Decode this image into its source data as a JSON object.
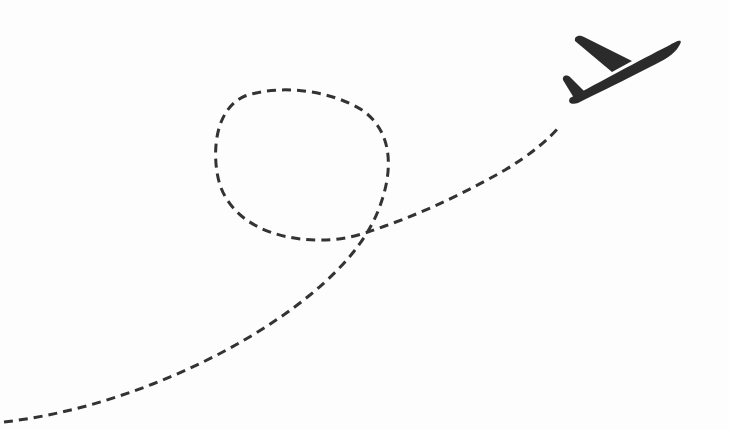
{
  "illustration": {
    "subject": "airplane-with-looping-dashed-flight-path",
    "colors": {
      "background": "#fdfdfd",
      "stroke": "#333333",
      "airplane": "#2b2b2b"
    },
    "path": {
      "style": "dashed",
      "dash_length": 9,
      "gap_length": 6,
      "stroke_width": 3
    },
    "airplane": {
      "icon": "airplane-icon",
      "direction": "up-right"
    }
  }
}
